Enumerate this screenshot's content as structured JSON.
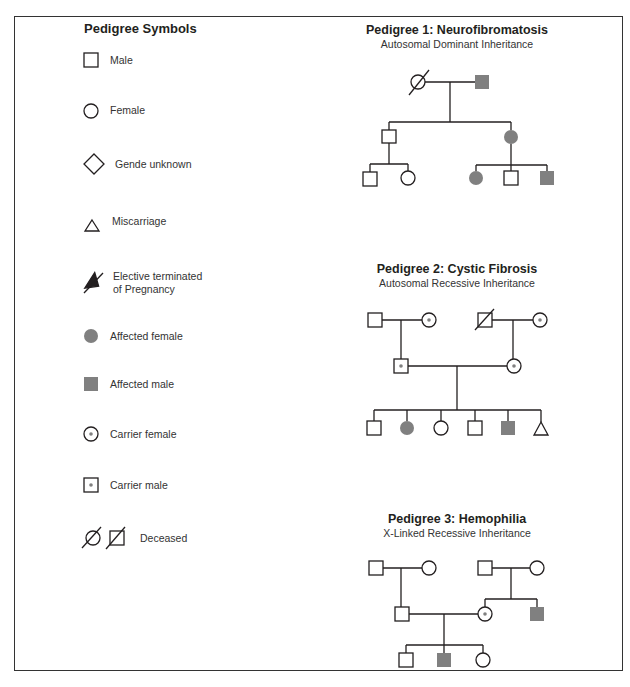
{
  "legend": {
    "title": "Pedigree Symbols",
    "items": [
      {
        "symbol": "male-square",
        "label": "Male"
      },
      {
        "symbol": "female-circle",
        "label": "Female"
      },
      {
        "symbol": "gender-unknown-diamond",
        "label": "Gende unknown"
      },
      {
        "symbol": "miscarriage-triangle",
        "label": "Miscarriage"
      },
      {
        "symbol": "elective-termination-triangle",
        "label_line1": "Elective terminated",
        "label_line2": "of Pregnancy"
      },
      {
        "symbol": "affected-female-circle",
        "label": "Affected female"
      },
      {
        "symbol": "affected-male-square",
        "label": "Affected male"
      },
      {
        "symbol": "carrier-female-circle",
        "label": "Carrier female"
      },
      {
        "symbol": "carrier-male-square",
        "label": "Carrier male"
      },
      {
        "symbol": "deceased-female-male",
        "label": "Deceased"
      }
    ]
  },
  "pedigrees": [
    {
      "title": "Pedigree 1: Neurofibromatosis",
      "subtitle": "Autosomal Dominant Inheritance",
      "generations": [
        [
          "deceased female",
          "affected male"
        ],
        [
          "unaffected male",
          "affected female"
        ],
        [
          "unaffected male",
          "unaffected female",
          "affected female",
          "unaffected male",
          "affected male"
        ]
      ]
    },
    {
      "title": "Pedigree 2: Cystic Fibrosis",
      "subtitle": "Autosomal Recessive Inheritance",
      "generations": [
        [
          "unaffected male",
          "carrier female",
          "deceased male",
          "carrier female"
        ],
        [
          "carrier male",
          "carrier female"
        ],
        [
          "unaffected male",
          "affected female",
          "unaffected female",
          "unaffected male",
          "affected male",
          "miscarriage"
        ]
      ]
    },
    {
      "title": "Pedigree 3: Hemophilia",
      "subtitle": "X-Linked Recessive Inheritance",
      "generations": [
        [
          "unaffected male",
          "unaffected female",
          "unaffected male",
          "unaffected female"
        ],
        [
          "unaffected male",
          "carrier female",
          "affected male"
        ],
        [
          "unaffected male",
          "affected male",
          "unaffected female"
        ]
      ]
    }
  ],
  "colors": {
    "affected_fill": "#808080",
    "carrier_dot": "#808080",
    "line": "#231f20"
  }
}
